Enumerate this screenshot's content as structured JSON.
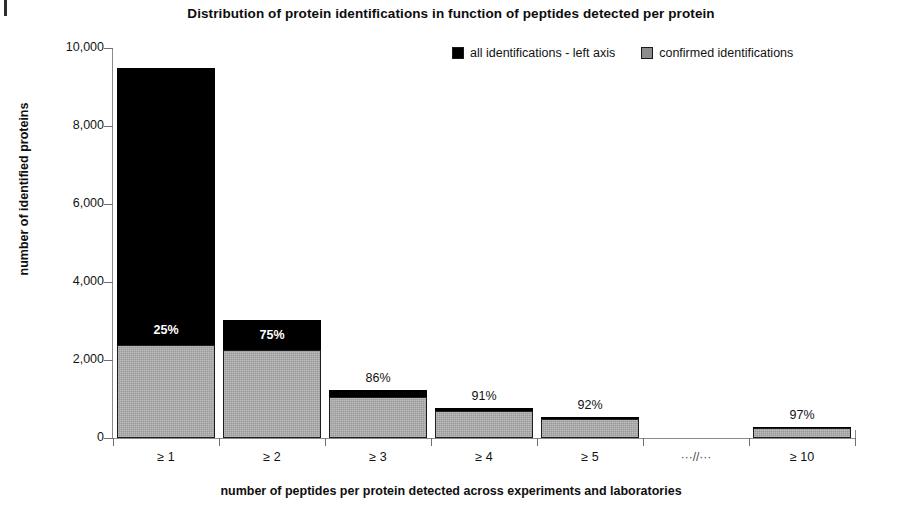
{
  "chart_data": {
    "type": "bar",
    "title": "Distribution of protein identifications in function of peptides detected per protein",
    "xlabel": "number of peptides per protein detected across experiments and laboratories",
    "ylabel": "number of identified proteins",
    "ylim": [
      0,
      10000
    ],
    "ytick_labels": [
      "10,000",
      "8,000",
      "6,000",
      "4,000",
      "2,000",
      "0"
    ],
    "ytick_values": [
      10000,
      8000,
      6000,
      4000,
      2000,
      0
    ],
    "grid": false,
    "legend_position": "top-right",
    "stacked": true,
    "categories": [
      "≥ 1",
      "≥ 2",
      "≥ 3",
      "≥ 4",
      "≥ 5",
      "···//···",
      "≥ 10"
    ],
    "series": [
      {
        "name": "all identifications - left axis",
        "color": "#000000",
        "values": [
          9500,
          3020,
          1230,
          770,
          530,
          null,
          270
        ]
      },
      {
        "name": "confirmed identifications",
        "color": "#9a9a9a",
        "values": [
          2375,
          2265,
          1060,
          700,
          490,
          null,
          260
        ]
      }
    ],
    "point_labels": [
      "25%",
      "75%",
      "86%",
      "91%",
      "92%",
      "",
      "97%"
    ],
    "point_label_placement": [
      "inside",
      "inside",
      "above",
      "above",
      "above",
      "none",
      "above"
    ]
  },
  "legend": {
    "entries": [
      {
        "label": "all identifications - left axis",
        "swatch": "black-square-icon"
      },
      {
        "label": "confirmed identifications",
        "swatch": "gray-square-icon"
      }
    ]
  }
}
